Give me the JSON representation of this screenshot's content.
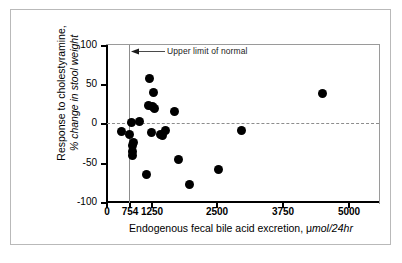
{
  "figure": {
    "background_color": "#ffffff",
    "frame_color": "#b9b9b9",
    "marker_color": "#000000",
    "reference_line_color": "#8d8d8d"
  },
  "annotation": {
    "text": "Upper limit of normal",
    "arrow_icon": "left-arrow-icon",
    "points_to_value": 754
  },
  "axes": {
    "x_ticks": [
      "0",
      "754",
      "1250",
      "2500",
      "3750",
      "5000"
    ],
    "y_ticks": [
      "100",
      "50",
      "0",
      "-50",
      "-100"
    ],
    "x_title_plain": "Endogenous fecal bile acid excretion, μ",
    "x_title_italic": "mol/24hr",
    "y_title_line1": "Response to cholestyramine,",
    "y_title_line2": "% change in stool weight"
  },
  "chart_data": {
    "type": "scatter",
    "title": "",
    "xlabel": "Endogenous fecal bile acid excretion, μmol/24hr",
    "ylabel": "Response to cholestyramine, % change in stool weight",
    "xlim": [
      0,
      5050
    ],
    "ylim": [
      -100,
      100
    ],
    "xticks": [
      0,
      754,
      1250,
      2500,
      3750,
      5000
    ],
    "yticks": [
      -100,
      -50,
      0,
      50,
      100
    ],
    "grid": false,
    "legend": null,
    "reference_lines": [
      {
        "orientation": "horizontal",
        "value": 0,
        "style": "dashed",
        "color": "#8d8d8d"
      },
      {
        "orientation": "vertical",
        "value": 754,
        "style": "solid",
        "color": "#8d8d8d",
        "label": "Upper limit of normal"
      }
    ],
    "annotations": [
      {
        "text": "Upper limit of normal",
        "x": 754,
        "y": 95,
        "arrow": "left"
      }
    ],
    "series": [
      {
        "name": "patients",
        "marker": "filled-circle",
        "color": "#000000",
        "points": [
          {
            "x": 330,
            "y": -9
          },
          {
            "x": 480,
            "y": -13
          },
          {
            "x": 520,
            "y": 2
          },
          {
            "x": 560,
            "y": -23
          },
          {
            "x": 555,
            "y": -27
          },
          {
            "x": 545,
            "y": -35
          },
          {
            "x": 550,
            "y": -40
          },
          {
            "x": 700,
            "y": 3
          },
          {
            "x": 830,
            "y": -64
          },
          {
            "x": 900,
            "y": 57
          },
          {
            "x": 880,
            "y": 24
          },
          {
            "x": 960,
            "y": 22
          },
          {
            "x": 990,
            "y": 40
          },
          {
            "x": 1010,
            "y": 19
          },
          {
            "x": 930,
            "y": -11
          },
          {
            "x": 1130,
            "y": -13
          },
          {
            "x": 1170,
            "y": -14
          },
          {
            "x": 1220,
            "y": -8
          },
          {
            "x": 1420,
            "y": 16
          },
          {
            "x": 1500,
            "y": -45
          },
          {
            "x": 1720,
            "y": -77
          },
          {
            "x": 2320,
            "y": -57
          },
          {
            "x": 2790,
            "y": -8
          },
          {
            "x": 4480,
            "y": 38
          }
        ]
      }
    ]
  }
}
